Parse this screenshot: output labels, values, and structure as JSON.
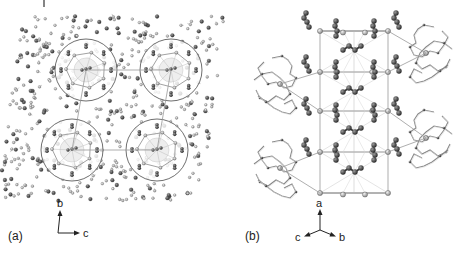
{
  "figure": {
    "panels": [
      {
        "label": "(a)",
        "description": "Crystal packing viewed along a-axis; four circled cluster motifs",
        "axes": {
          "vertical": "b",
          "horizontal": "c"
        }
      },
      {
        "label": "(b)",
        "description": "Unit cell framework with chain units and macrocyclic ligands",
        "axes": {
          "up": "a",
          "left": "c",
          "right": "b"
        }
      }
    ],
    "colors": {
      "dark_atom": "#3a3a3a",
      "light_atom": "#bdbdbd",
      "bond": "#8a8a8a",
      "circle": "#6f6f6f",
      "background": "#ffffff"
    }
  }
}
